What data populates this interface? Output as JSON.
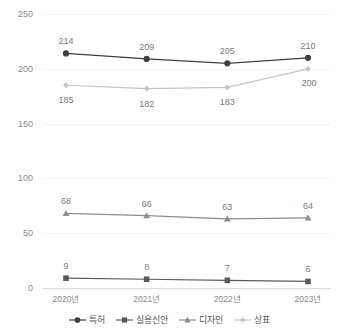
{
  "header": {
    "clipped_text": ""
  },
  "chart_data": {
    "type": "line",
    "title": "",
    "xlabel": "",
    "ylabel": "",
    "categories": [
      "2020년",
      "2021년",
      "2022년",
      "2023년"
    ],
    "ylim": [
      0,
      250
    ],
    "yticks": [
      0,
      50,
      100,
      150,
      200,
      250
    ],
    "ytick_labels": [
      "0",
      "50",
      "100",
      "150",
      "200",
      "250"
    ],
    "grid": true,
    "legend_position": "bottom",
    "series": [
      {
        "name": "특허",
        "values": [
          214,
          209,
          205,
          210
        ],
        "labels": [
          "214",
          "209",
          "205",
          "210"
        ],
        "color": "#3f3f3f",
        "marker": "circle",
        "label_side": "above"
      },
      {
        "name": "실용신안",
        "values": [
          9,
          8,
          7,
          6
        ],
        "labels": [
          "9",
          "8",
          "7",
          "6"
        ],
        "color": "#5a5a5a",
        "marker": "square",
        "label_side": "above"
      },
      {
        "name": "디자인",
        "values": [
          68,
          66,
          63,
          64
        ],
        "labels": [
          "68",
          "66",
          "63",
          "64"
        ],
        "color": "#8c8c8c",
        "marker": "triangle",
        "label_side": "above"
      },
      {
        "name": "상표",
        "values": [
          185,
          182,
          183,
          200
        ],
        "labels": [
          "185",
          "182",
          "183",
          "200"
        ],
        "color": "#c4c4c4",
        "marker": "diamond",
        "label_side": "below"
      }
    ]
  },
  "colors": {
    "gridline": "#f4f4f6",
    "axis": "#dcdcdc",
    "tick_text": "#8a8a8a",
    "data_label_text": "#7a7a7a",
    "legend_text": "#555555",
    "background": "#ffffff"
  }
}
